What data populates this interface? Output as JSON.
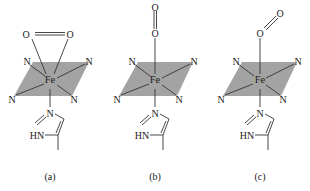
{
  "figure": {
    "colors": {
      "plane": "#a3a3a3",
      "lines": "#333333",
      "text": "#222222",
      "background": "#ffffff"
    },
    "atoms": {
      "iron": "Fe",
      "nitrogen": "N",
      "oxygen": "O",
      "imidazole_nh": "HN"
    },
    "panels": [
      {
        "id": "a",
        "label": "(a)",
        "binding": "side-on (η2)"
      },
      {
        "id": "b",
        "label": "(b)",
        "binding": "end-on linear"
      },
      {
        "id": "c",
        "label": "(c)",
        "binding": "end-on bent"
      }
    ]
  }
}
